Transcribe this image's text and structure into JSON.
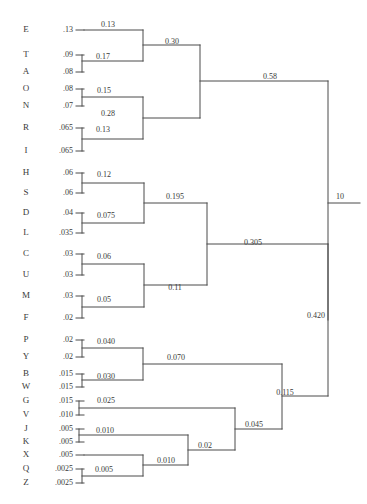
{
  "chart_data": {
    "type": "tree",
    "title": "",
    "xlabel": "",
    "ylabel": "",
    "grid": false,
    "legend": "none",
    "leaves": [
      {
        "letter": "E",
        "value": ".13",
        "y": 30
      },
      {
        "letter": "T",
        "value": ".09",
        "y": 55
      },
      {
        "letter": "A",
        "value": ".08",
        "y": 72
      },
      {
        "letter": "O",
        "value": ".08",
        "y": 89
      },
      {
        "letter": "N",
        "value": ".07",
        "y": 106
      },
      {
        "letter": "R",
        "value": ".065",
        "y": 128
      },
      {
        "letter": "I",
        "value": ".065",
        "y": 151
      },
      {
        "letter": "H",
        "value": ".06",
        "y": 173
      },
      {
        "letter": "S",
        "value": ".06",
        "y": 193
      },
      {
        "letter": "D",
        "value": ".04",
        "y": 213
      },
      {
        "letter": "L",
        "value": ".035",
        "y": 233
      },
      {
        "letter": "C",
        "value": ".03",
        "y": 254
      },
      {
        "letter": "U",
        "value": ".03",
        "y": 275
      },
      {
        "letter": "M",
        "value": ".03",
        "y": 296
      },
      {
        "letter": "F",
        "value": ".02",
        "y": 318
      },
      {
        "letter": "P",
        "value": ".02",
        "y": 340
      },
      {
        "letter": "Y",
        "value": ".02",
        "y": 357
      },
      {
        "letter": "B",
        "value": ".015",
        "y": 374
      },
      {
        "letter": "W",
        "value": ".015",
        "y": 387
      },
      {
        "letter": "G",
        "value": ".015",
        "y": 401
      },
      {
        "letter": "V",
        "value": ".010",
        "y": 415
      },
      {
        "letter": "J",
        "value": ".005",
        "y": 429
      },
      {
        "letter": "K",
        "value": ".005",
        "y": 442
      },
      {
        "letter": "X",
        "value": ".005",
        "y": 455
      },
      {
        "letter": "Q",
        "value": ".0025",
        "y": 469
      },
      {
        "letter": "Z",
        "value": ".0025",
        "y": 483
      }
    ],
    "merges": [
      {
        "id": "TA",
        "label": "0.17",
        "x": 82,
        "y": 61,
        "y1": 55,
        "y2": 72,
        "label_x": 103,
        "label_y": 57
      },
      {
        "id": "E_TA",
        "label": "0.13",
        "x": 143,
        "y": 45,
        "y1": 30,
        "y2": 61,
        "label_x": 108,
        "label_y": 25
      },
      {
        "id": "ON",
        "label": "0.15",
        "x": 82,
        "y": 97,
        "y1": 89,
        "y2": 106,
        "label_x": 104,
        "label_y": 91
      },
      {
        "id": "RI",
        "label": "0.13",
        "x": 82,
        "y": 139,
        "y1": 128,
        "y2": 151,
        "label_x": 103,
        "label_y": 130
      },
      {
        "id": "ON_RI",
        "label": "0.28",
        "x": 143,
        "y": 118,
        "y1": 97,
        "y2": 139,
        "label_x": 108,
        "label_y": 114
      },
      {
        "id": "TOP1",
        "label": "0.30",
        "x": 200,
        "y": 81,
        "y1": 45,
        "y2": 118,
        "label_x": 172,
        "label_y": 42
      },
      {
        "id": "HS",
        "label": "0.12",
        "x": 82,
        "y": 183,
        "y1": 173,
        "y2": 193,
        "label_x": 104,
        "label_y": 175
      },
      {
        "id": "DL",
        "label": "0.075",
        "x": 82,
        "y": 223,
        "y1": 213,
        "y2": 233,
        "label_x": 106,
        "label_y": 216
      },
      {
        "id": "HS_DL",
        "label": "0.195",
        "x": 144,
        "y": 203,
        "y1": 183,
        "y2": 223,
        "label_x": 175,
        "label_y": 197
      },
      {
        "id": "CU",
        "label": "0.06",
        "x": 82,
        "y": 264,
        "y1": 254,
        "y2": 275,
        "label_x": 104,
        "label_y": 257
      },
      {
        "id": "MF",
        "label": "0.05",
        "x": 82,
        "y": 307,
        "y1": 296,
        "y2": 318,
        "label_x": 104,
        "label_y": 300
      },
      {
        "id": "CU_MF",
        "label": "0.11",
        "x": 144,
        "y": 285,
        "y1": 264,
        "y2": 307,
        "label_x": 175,
        "label_y": 288
      },
      {
        "id": "MID",
        "label": "0.305",
        "x": 207,
        "y": 244,
        "y1": 203,
        "y2": 285,
        "label_x": 253,
        "label_y": 243
      },
      {
        "id": "PY",
        "label": "0.040",
        "x": 82,
        "y": 348,
        "y1": 340,
        "y2": 357,
        "label_x": 106,
        "label_y": 342
      },
      {
        "id": "BW",
        "label": "0.030",
        "x": 82,
        "y": 380,
        "y1": 374,
        "y2": 387,
        "label_x": 106,
        "label_y": 377
      },
      {
        "id": "PY_BW",
        "label": "0.070",
        "x": 143,
        "y": 364,
        "y1": 348,
        "y2": 380,
        "label_x": 176,
        "label_y": 358
      },
      {
        "id": "GV",
        "label": "0.025",
        "x": 79,
        "y": 408,
        "y1": 401,
        "y2": 415,
        "label_x": 106,
        "label_y": 401
      },
      {
        "id": "JK",
        "label": "0.010",
        "x": 79,
        "y": 435,
        "y1": 429,
        "y2": 442,
        "label_x": 105,
        "label_y": 431
      },
      {
        "id": "QZ",
        "label": "0.005",
        "x": 82,
        "y": 476,
        "y1": 469,
        "y2": 483,
        "label_x": 104,
        "label_y": 470
      },
      {
        "id": "X_QZ",
        "label": "0.010",
        "x": 143,
        "y": 465,
        "y1": 455,
        "y2": 476,
        "label_x": 166,
        "label_y": 461
      },
      {
        "id": "JK_XQZ",
        "label": "0.02",
        "x": 188,
        "y": 450,
        "y1": 435,
        "y2": 465,
        "label_x": 205,
        "label_y": 446
      },
      {
        "id": "GV_REST",
        "label": "0.045",
        "x": 235,
        "y": 429,
        "y1": 408,
        "y2": 450,
        "label_x": 254,
        "label_y": 425
      },
      {
        "id": "LOW",
        "label": "0.115",
        "x": 282,
        "y": 396,
        "y1": 364,
        "y2": 429,
        "label_x": 285,
        "label_y": 393
      },
      {
        "id": "RIGHT",
        "label": "0.420",
        "x": 328,
        "y": 320,
        "y1": 244,
        "y2": 396,
        "label_x": 316,
        "label_y": 316
      },
      {
        "id": "ROOT",
        "label": "0.58",
        "x": 328,
        "y": 81,
        "y1": 81,
        "y2": 81,
        "label_x": 270,
        "label_y": 77
      }
    ],
    "root": {
      "x": 328,
      "top_y": 81,
      "bottom_y": 320,
      "tick_y": 203,
      "tick_x2": 360
    },
    "scale_label": "10",
    "scale_label_x": 340,
    "scale_label_y": 197,
    "geometry": {
      "letter_x": 26,
      "value_x": 73,
      "leaf_stub_x1": 76,
      "leaf_stub_x2": 84
    },
    "colors": {
      "background": "#ffffff",
      "line": "#4a4a4a",
      "text": "#3a3a3a"
    }
  }
}
